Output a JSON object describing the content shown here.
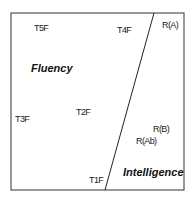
{
  "diagram": {
    "regions": [
      {
        "name": "Fluency"
      },
      {
        "name": "Intelligence"
      }
    ],
    "points": [
      {
        "label": "T5F"
      },
      {
        "label": "T4F"
      },
      {
        "label": "R(A)"
      },
      {
        "label": "T3F"
      },
      {
        "label": "T2F"
      },
      {
        "label": "R(B)"
      },
      {
        "label": "R(Ab)"
      },
      {
        "label": "T1F"
      }
    ]
  }
}
